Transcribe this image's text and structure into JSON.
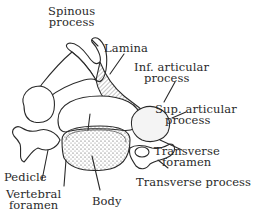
{
  "figure": {
    "ink_color": "#2a2a2a",
    "background": "#ffffff"
  },
  "labels": {
    "spinous_process": [
      "Spinous",
      "process"
    ],
    "lamina": "Lamina",
    "inf_articular_process": [
      "Inf. articular",
      "process"
    ],
    "sup_articular_process": [
      "Sup. articular",
      "process"
    ],
    "transverse_foramen": [
      "Transverse",
      "foramen"
    ],
    "transverse_process": "Transverse process",
    "pedicle": "Pedicle",
    "vertebral_foramen": [
      "Vertebral",
      "foramen"
    ],
    "body": "Body"
  }
}
